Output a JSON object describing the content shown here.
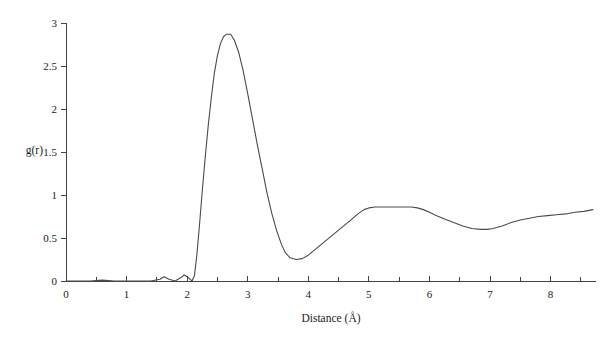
{
  "chart_data": {
    "type": "line",
    "title": "",
    "xlabel": "Distance (Å)",
    "ylabel": "g(r)",
    "xlim": [
      0,
      8.75
    ],
    "ylim": [
      0,
      3
    ],
    "grid": false,
    "legend": null,
    "xticks": [
      0,
      1,
      2,
      3,
      4,
      5,
      6,
      7,
      8
    ],
    "xtick_labels": [
      "0",
      "1",
      "2",
      "3",
      "4",
      "5",
      "6",
      "7",
      "8"
    ],
    "x_minor_ticks": [
      0.5,
      1.5,
      2.5,
      3.5,
      4.5,
      5.5,
      6.5,
      7.5,
      8.5
    ],
    "yticks": [
      0,
      0.5,
      1,
      1.5,
      2,
      2.5,
      3
    ],
    "ytick_labels": [
      "0",
      "0.5",
      "1",
      "1.5",
      "2",
      "2.5",
      "3"
    ],
    "series": [
      {
        "name": "g(r)",
        "color": "#4a4a4a",
        "x": [
          0.0,
          0.2,
          0.4,
          0.6,
          0.8,
          1.0,
          1.2,
          1.4,
          1.55,
          1.62,
          1.7,
          1.8,
          1.9,
          1.95,
          2.0,
          2.05,
          2.08,
          2.12,
          2.16,
          2.2,
          2.25,
          2.3,
          2.35,
          2.4,
          2.45,
          2.5,
          2.55,
          2.6,
          2.65,
          2.72,
          2.78,
          2.85,
          2.92,
          3.0,
          3.08,
          3.16,
          3.24,
          3.32,
          3.4,
          3.48,
          3.56,
          3.62,
          3.7,
          3.8,
          3.9,
          4.0,
          4.12,
          4.24,
          4.36,
          4.48,
          4.6,
          4.72,
          4.82,
          4.92,
          5.0,
          5.1,
          5.25,
          5.4,
          5.55,
          5.7,
          5.8,
          5.9,
          6.0,
          6.12,
          6.25,
          6.4,
          6.55,
          6.7,
          6.85,
          6.95,
          7.05,
          7.2,
          7.35,
          7.5,
          7.65,
          7.8,
          7.95,
          8.1,
          8.25,
          8.4,
          8.55,
          8.7
        ],
        "y": [
          0.0,
          0.0,
          0.0,
          0.01,
          0.0,
          0.0,
          0.0,
          0.0,
          0.02,
          0.05,
          0.02,
          0.0,
          0.04,
          0.07,
          0.05,
          0.02,
          0.0,
          0.06,
          0.3,
          0.62,
          1.05,
          1.45,
          1.82,
          2.14,
          2.42,
          2.62,
          2.76,
          2.84,
          2.87,
          2.87,
          2.8,
          2.66,
          2.46,
          2.18,
          1.88,
          1.58,
          1.3,
          1.02,
          0.78,
          0.58,
          0.42,
          0.33,
          0.27,
          0.25,
          0.26,
          0.3,
          0.37,
          0.44,
          0.51,
          0.58,
          0.65,
          0.72,
          0.78,
          0.83,
          0.85,
          0.86,
          0.86,
          0.86,
          0.86,
          0.86,
          0.85,
          0.83,
          0.8,
          0.76,
          0.72,
          0.68,
          0.64,
          0.61,
          0.6,
          0.6,
          0.61,
          0.64,
          0.68,
          0.71,
          0.73,
          0.75,
          0.76,
          0.77,
          0.78,
          0.8,
          0.81,
          0.83
        ]
      }
    ],
    "annotations": {
      "first_peak_position": 2.72,
      "first_peak_height": 2.87,
      "first_minimum_position": 3.62,
      "first_minimum_value": 0.25,
      "second_maximum_position": 5.3,
      "second_maximum_value": 0.86,
      "second_minimum_position": 6.9,
      "second_minimum_value": 0.6
    }
  }
}
